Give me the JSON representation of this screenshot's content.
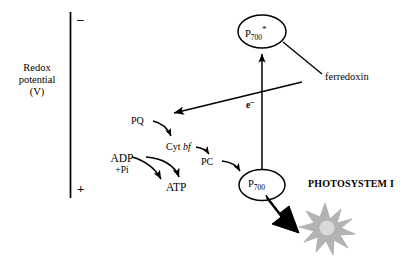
{
  "diagram": {
    "axis": {
      "name": "redox-potential-axis",
      "label_line1": "Redox",
      "label_line2": "potential",
      "label_line3": "(V)",
      "top_sign": "–",
      "bottom_sign": "+"
    },
    "nodes": {
      "p700_excited": {
        "text_main": "P",
        "text_sub": "700",
        "text_sup": "*"
      },
      "p700": {
        "text_main": "P",
        "text_sub": "700"
      },
      "pq": "PQ",
      "cyt_prefix": "Cyt ",
      "cyt_italic": "bf",
      "pc": "PC",
      "adp": "ADP",
      "pi": "+Pi",
      "atp": "ATP",
      "electron_main": "e",
      "electron_sup": "–",
      "ferredoxin": "ferredoxin",
      "photosystem": "PHOTOSYSTEM I"
    },
    "colors": {
      "stroke": "#000000",
      "fill": "#ffffff",
      "starburst": "#b3b3b3",
      "starburst_core": "#d9d9d9",
      "light_arrow": "#000000"
    }
  }
}
